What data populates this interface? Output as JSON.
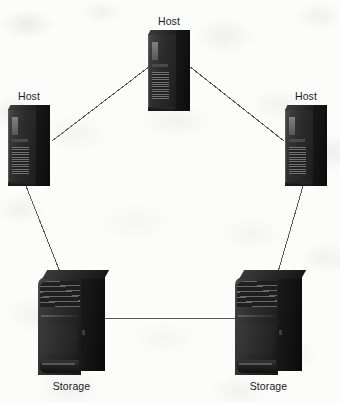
{
  "diagram": {
    "background_color": "#fcfcfb",
    "link_color": "#575757",
    "label_color": "#1c1c1c"
  },
  "nodes": [
    {
      "id": "host-top",
      "label": "Host",
      "type": "host",
      "icon": "server-tower-icon",
      "x": 148,
      "y": 30,
      "width": 42,
      "height": 81
    },
    {
      "id": "host-left",
      "label": "Host",
      "type": "host",
      "icon": "server-tower-icon",
      "x": 8,
      "y": 105,
      "width": 42,
      "height": 81
    },
    {
      "id": "host-right",
      "label": "Host",
      "type": "host",
      "icon": "server-tower-icon",
      "x": 285,
      "y": 105,
      "width": 42,
      "height": 81
    },
    {
      "id": "storage-left",
      "label": "Storage",
      "type": "storage",
      "icon": "storage-array-icon",
      "x": 38,
      "y": 268,
      "width": 67,
      "height": 107
    },
    {
      "id": "storage-right",
      "label": "Storage",
      "type": "storage",
      "icon": "storage-array-icon",
      "x": 235,
      "y": 268,
      "width": 67,
      "height": 107
    }
  ],
  "links": [
    {
      "id": "link-host-top-host-left",
      "from": "host-top",
      "to": "host-left",
      "x1": 150,
      "y1": 66,
      "x2": 52,
      "y2": 141
    },
    {
      "id": "link-host-top-host-right",
      "from": "host-top",
      "to": "host-right",
      "x1": 189,
      "y1": 66,
      "x2": 284,
      "y2": 141
    },
    {
      "id": "link-host-left-storage-left",
      "from": "host-left",
      "to": "storage-left",
      "x1": 26,
      "y1": 186,
      "x2": 60,
      "y2": 272
    },
    {
      "id": "link-host-right-storage-right",
      "from": "host-right",
      "to": "storage-right",
      "x1": 303,
      "y1": 186,
      "x2": 278,
      "y2": 272
    },
    {
      "id": "link-storage-left-storage-right",
      "from": "storage-left",
      "to": "storage-right",
      "x1": 104,
      "y1": 318,
      "x2": 236,
      "y2": 318
    }
  ]
}
